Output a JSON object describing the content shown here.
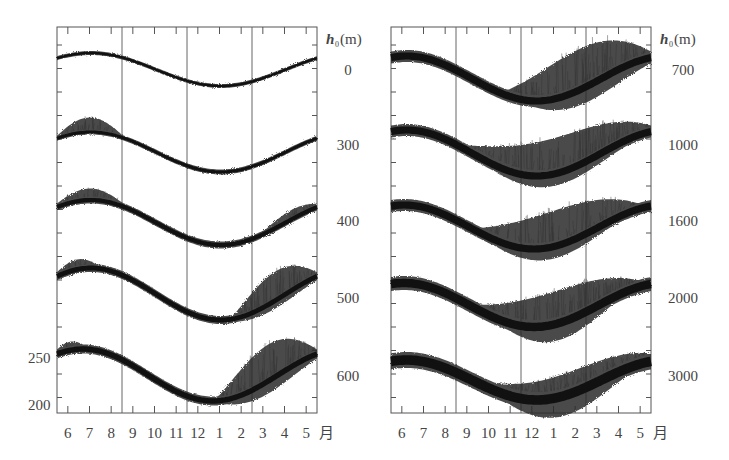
{
  "chart_data": [
    {
      "type": "line",
      "title": "",
      "panel": "left",
      "xlabel": "月",
      "x_tick_labels": [
        "6",
        "7",
        "8",
        "9",
        "10",
        "11",
        "12",
        "1",
        "2",
        "3",
        "4",
        "5"
      ],
      "ylabel": "",
      "y_tick_labels": [
        "250",
        "200"
      ],
      "y_ticks_values": [
        250,
        200
      ],
      "grid": "vertical lines between Aug/Sep, Nov/Dec, Feb/Mar",
      "legend_title": "h0(m)",
      "series": [
        {
          "name": "0",
          "shape": "sinusoid",
          "max_month": "7",
          "min_month": "1",
          "spread": "narrow"
        },
        {
          "name": "300",
          "shape": "sinusoid",
          "max_month": "7",
          "min_month": "1",
          "spread": "narrow, scatter in Jun-Jul"
        },
        {
          "name": "400",
          "shape": "sinusoid",
          "max_month": "7",
          "min_month": "1",
          "spread": "moderate, scatter in Jun-Aug and Apr-May"
        },
        {
          "name": "500",
          "shape": "sinusoid",
          "max_month": "7",
          "min_month": "1",
          "spread": "scatter Jun and Feb-May"
        },
        {
          "name": "600",
          "shape": "sinusoid",
          "max_month": "7",
          "min_month": "1",
          "spread": "wide scatter Jan-May",
          "approx_range": [
            200,
            250
          ]
        }
      ]
    },
    {
      "type": "line",
      "title": "",
      "panel": "right",
      "xlabel": "月",
      "x_tick_labels": [
        "6",
        "7",
        "8",
        "9",
        "10",
        "11",
        "12",
        "1",
        "2",
        "3",
        "4",
        "5"
      ],
      "grid": "vertical lines between Aug/Sep, Nov/Dec, Feb/Mar",
      "legend_title": "h0(m)",
      "series": [
        {
          "name": "700",
          "shape": "sinusoid",
          "max_month": "6",
          "min_month": "1",
          "spread": "wide scatter Dec-May"
        },
        {
          "name": "1000",
          "shape": "sinusoid",
          "max_month": "6",
          "min_month": "1",
          "spread": "wide scatter Oct-May"
        },
        {
          "name": "1600",
          "shape": "sinusoid",
          "max_month": "6",
          "min_month": "1",
          "spread": "wide scatter Oct-Apr"
        },
        {
          "name": "2000",
          "shape": "sinusoid",
          "max_month": "6",
          "min_month": "1",
          "spread": "wide scatter Oct-Apr"
        },
        {
          "name": "3000",
          "shape": "sinusoid",
          "max_month": "6",
          "min_month": "1",
          "spread": "very wide band Nov-Mar"
        }
      ]
    }
  ],
  "labels": {
    "h0_unit_left": "(m)",
    "h0_unit_right": "(m)",
    "h0_symbol": "h",
    "h0_sub": "0",
    "left_h_values": [
      "0",
      "300",
      "400",
      "500",
      "600"
    ],
    "right_h_values": [
      "700",
      "1000",
      "1600",
      "2000",
      "3000"
    ],
    "left_y_ticks": [
      "250",
      "200"
    ],
    "months": [
      "6",
      "7",
      "8",
      "9",
      "10",
      "11",
      "12",
      "1",
      "2",
      "3",
      "4",
      "5"
    ],
    "month_suffix": "月"
  }
}
